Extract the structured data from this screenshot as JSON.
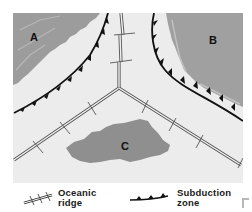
{
  "diagram": {
    "type": "plate-tectonics-map",
    "plates": [
      {
        "id": "A",
        "label": "A",
        "color": "#9a9a9a"
      },
      {
        "id": "B",
        "label": "B",
        "color": "#9e9e9e"
      },
      {
        "id": "C",
        "label": "C",
        "color": "#8f8f8f"
      }
    ],
    "ocean_color": "#ededed",
    "legend": {
      "ridge": {
        "line1": "Oceanic",
        "line2": "ridge"
      },
      "subduction": {
        "line1": "Subduction",
        "line2": "zone"
      }
    }
  }
}
